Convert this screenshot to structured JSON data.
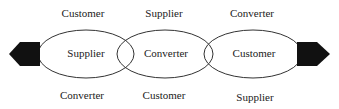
{
  "diagram": {
    "top_labels": [
      "Customer",
      "Supplier",
      "Converter"
    ],
    "ellipse_labels": [
      "Supplier",
      "Converter",
      "Customer"
    ],
    "bottom_labels": [
      "Converter",
      "Customer",
      "Supplier"
    ],
    "arrows": [
      "left-arrow",
      "right-arrow"
    ]
  }
}
